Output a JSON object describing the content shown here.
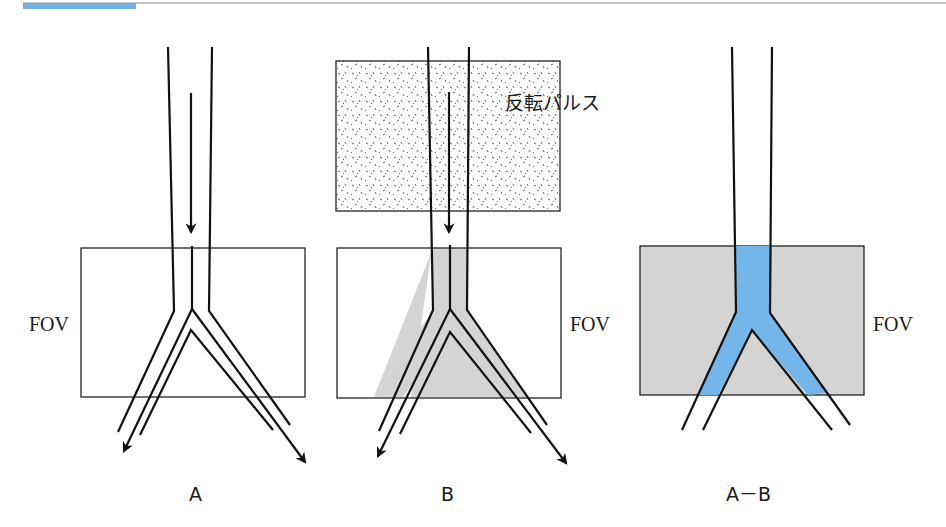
{
  "header": {
    "accent_color": "#6fb1e4",
    "rule_color": "#888888"
  },
  "colors": {
    "stroke": "#111111",
    "gray_fill": "#d6d6d6",
    "blue_fill": "#74b6ea",
    "dot_color": "#555555"
  },
  "panels": [
    {
      "id": "A",
      "caption": "A",
      "fov_label": "FOV"
    },
    {
      "id": "B",
      "caption": "B",
      "fov_label": "FOV",
      "pulse_label": "反転パルス"
    },
    {
      "id": "A-B",
      "caption": "A－B",
      "fov_label": "FOV"
    }
  ]
}
